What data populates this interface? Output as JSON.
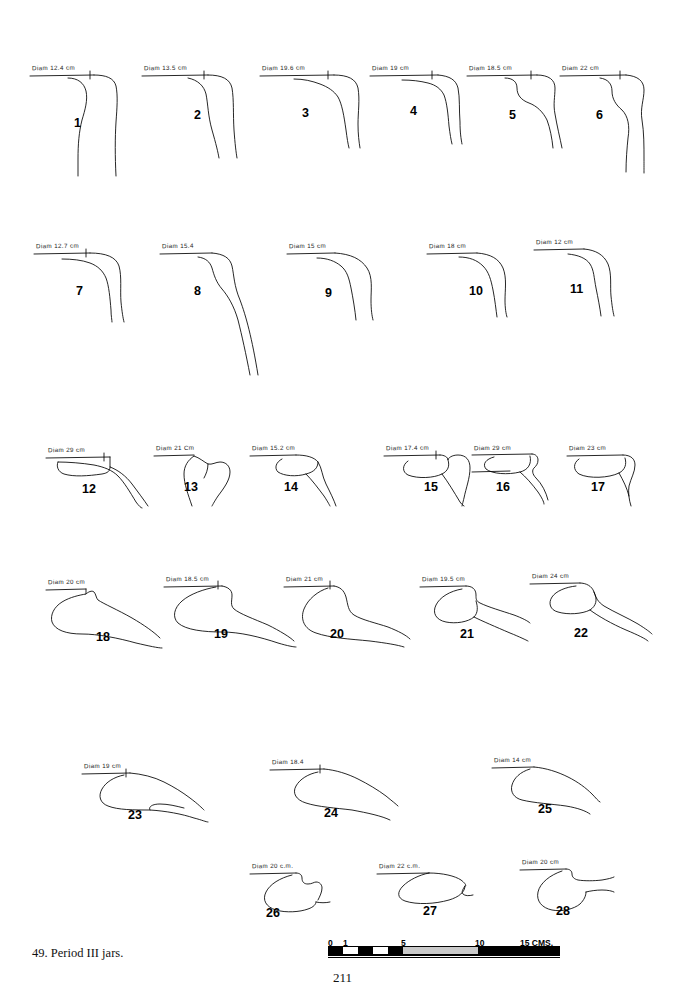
{
  "plate": {
    "caption": "49. Period III jars.",
    "page_number": "211"
  },
  "scale": {
    "unit_label": "15 CMS.",
    "ticks": [
      {
        "label": "0",
        "value": 0
      },
      {
        "label": "1",
        "value": 1
      },
      {
        "label": "5",
        "value": 5
      },
      {
        "label": "10",
        "value": 10
      }
    ],
    "max": 15
  },
  "figures": [
    {
      "id": "1",
      "number": "1",
      "diam": "Diam 12.4 cm"
    },
    {
      "id": "2",
      "number": "2",
      "diam": "Diam 13.5 cm"
    },
    {
      "id": "3",
      "number": "3",
      "diam": "Diam 19.6 cm"
    },
    {
      "id": "4",
      "number": "4",
      "diam": "Diam 19 cm"
    },
    {
      "id": "5",
      "number": "5",
      "diam": "Diam 18.5 cm"
    },
    {
      "id": "6",
      "number": "6",
      "diam": "Diam 22 cm"
    },
    {
      "id": "7",
      "number": "7",
      "diam": "Diam 12.7 cm"
    },
    {
      "id": "8",
      "number": "8",
      "diam": "Diam 15.4"
    },
    {
      "id": "9",
      "number": "9",
      "diam": "Diam 15 cm"
    },
    {
      "id": "10",
      "number": "10",
      "diam": "Diam 18 cm"
    },
    {
      "id": "11",
      "number": "11",
      "diam": "Diam 12 cm"
    },
    {
      "id": "12",
      "number": "12",
      "diam": "Diam 29 cm"
    },
    {
      "id": "13",
      "number": "13",
      "diam": "Diam 21 Cm"
    },
    {
      "id": "14",
      "number": "14",
      "diam": "Diam 15.2 cm"
    },
    {
      "id": "15",
      "number": "15",
      "diam": "Diam 17.4 cm"
    },
    {
      "id": "16",
      "number": "16",
      "diam": "Diam 29 cm"
    },
    {
      "id": "17",
      "number": "17",
      "diam": "Diam 23 cm"
    },
    {
      "id": "18",
      "number": "18",
      "diam": "Diam 20 cm"
    },
    {
      "id": "19",
      "number": "19",
      "diam": "Diam 18.5 cm"
    },
    {
      "id": "20",
      "number": "20",
      "diam": "Diam 21 cm"
    },
    {
      "id": "21",
      "number": "21",
      "diam": "Diam 19.5 cm"
    },
    {
      "id": "22",
      "number": "22",
      "diam": "Diam 24 cm"
    },
    {
      "id": "23",
      "number": "23",
      "diam": "Diam 19 cm"
    },
    {
      "id": "24",
      "number": "24",
      "diam": "Diam 18.4"
    },
    {
      "id": "25",
      "number": "25",
      "diam": "Diam 14 cm"
    },
    {
      "id": "26",
      "number": "26",
      "diam": "Diam 20 c.m."
    },
    {
      "id": "27",
      "number": "27",
      "diam": "Diam 22 c.m."
    },
    {
      "id": "28",
      "number": "28",
      "diam": "Diam 20 cm"
    }
  ]
}
